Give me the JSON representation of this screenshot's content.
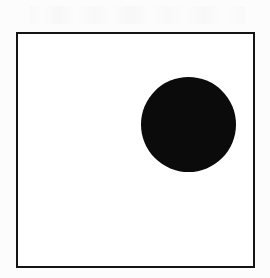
{
  "figure": {
    "background_color": "#fcfcfc",
    "frame": {
      "label": "Rectangular border frame",
      "stroke_color": "#141414",
      "fill_color": "#ffffff",
      "stroke_width_px": 2,
      "left_px": 16,
      "top_px": 32,
      "width_px": 239,
      "height_px": 236
    },
    "shapes": [
      {
        "name": "black-circle",
        "type": "circle",
        "fill_color": "#0b0b0b",
        "center_x_px": 188,
        "center_y_px": 124,
        "diameter_px": 95,
        "radius_px": 47.5,
        "quadrant": "upper-right"
      }
    ],
    "artifacts": {
      "scan_noise_band": "faint bleed-through marks above frame"
    }
  },
  "chart_data": {
    "type": "scatter",
    "title": "",
    "subtitle": "",
    "xlabel": "",
    "ylabel": "",
    "grid": false,
    "legend": null,
    "xlim": [
      0,
      239
    ],
    "ylim": [
      0,
      236
    ],
    "tick_labels": {
      "x": [],
      "y": []
    },
    "annotations": [],
    "points": [
      {
        "label": "",
        "x": 172,
        "y": 144,
        "marker_size_px": 95,
        "color": "#0b0b0b"
      }
    ]
  }
}
